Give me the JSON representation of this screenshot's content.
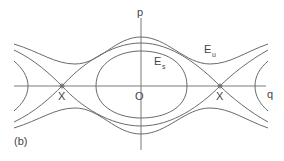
{
  "diagram": {
    "type": "phase-portrait",
    "panel_label": "(b)",
    "axes": {
      "vertical": "p",
      "horizontal": "q"
    },
    "origin_label": "O",
    "saddle_points": [
      {
        "label": "X",
        "position": "left"
      },
      {
        "label": "X",
        "position": "right"
      }
    ],
    "energy_labels": [
      {
        "main": "E",
        "sub": "s",
        "curve": "inner closed orbit"
      },
      {
        "main": "E",
        "sub": "u",
        "curve": "outer unbounded orbit"
      }
    ],
    "colors": {
      "stroke": "#6a6a6a",
      "background": "#ffffff"
    }
  }
}
